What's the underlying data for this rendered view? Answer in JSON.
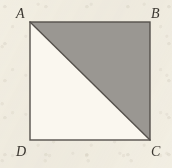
{
  "figure": {
    "kind": "geometry-diagram",
    "background_color": "#f2efe6",
    "line_color": "#55514c",
    "shaded_fill_color": "#9a9792",
    "unshaded_fill_color": "#faf7ef",
    "label_color": "#3a3630",
    "square": {
      "name": "ABCD",
      "left": 30,
      "top": 22,
      "right": 150,
      "bottom": 140,
      "stroke_width": 1.4
    },
    "diagonal": {
      "from": "A",
      "to": "C",
      "x1": 30,
      "y1": 22,
      "x2": 150,
      "y2": 140
    },
    "shaded_region": {
      "name": "ABC",
      "points": "30,22 150,22 150,140",
      "shaded": true
    },
    "unshaded_region": {
      "name": "ACD",
      "points": "30,22 150,140 30,140",
      "shaded": false
    },
    "vertices": [
      {
        "id": "A",
        "label": "A",
        "x": 30,
        "y": 22,
        "position": "top-left"
      },
      {
        "id": "B",
        "label": "B",
        "x": 150,
        "y": 22,
        "position": "top-right"
      },
      {
        "id": "C",
        "label": "C",
        "x": 150,
        "y": 140,
        "position": "bottom-right"
      },
      {
        "id": "D",
        "label": "D",
        "x": 30,
        "y": 140,
        "position": "bottom-left"
      }
    ]
  }
}
